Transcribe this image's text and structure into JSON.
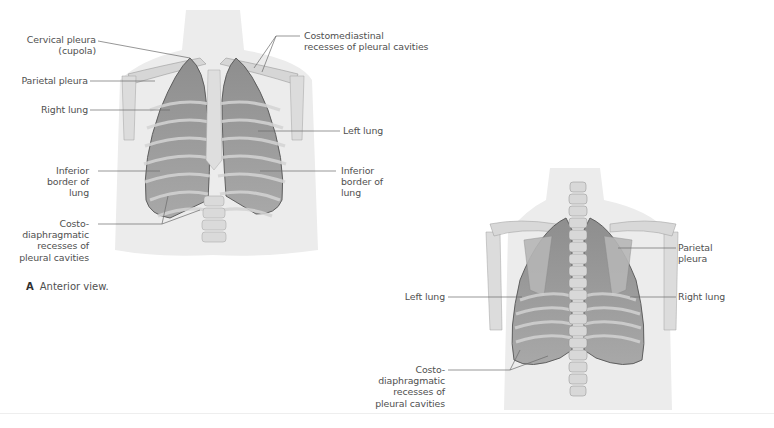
{
  "figure": {
    "panel_a": {
      "caption_letter": "A",
      "caption_text": "Anterior view.",
      "labels": {
        "cervical_pleura": "Cervical pleura\n(cupola)",
        "parietal_pleura": "Parietal pleura",
        "right_lung": "Right lung",
        "inferior_border_right": "Inferior\nborder of\nlung",
        "costodiaphragmatic": "Costo-\ndiaphragmatic\nrecesses of\npleural cavities",
        "costomediastinal": "Costomediastinal\nrecesses of pleural cavities",
        "left_lung": "Left lung",
        "inferior_border_left": "Inferior\nborder of\nlung"
      }
    },
    "panel_b": {
      "labels": {
        "parietal_pleura": "Parietal\npleura",
        "left_lung": "Left lung",
        "right_lung": "Right lung",
        "costodiaphragmatic": "Costo-\ndiaphragmatic\nrecesses of\npleural cavities"
      }
    }
  },
  "colors": {
    "background": "#ffffff",
    "label_text": "#505050",
    "leader_line": "#6a6a6a",
    "lung_fill": "#9a9a9a",
    "bone": "#d8d8d8",
    "skin": "#ececec"
  }
}
